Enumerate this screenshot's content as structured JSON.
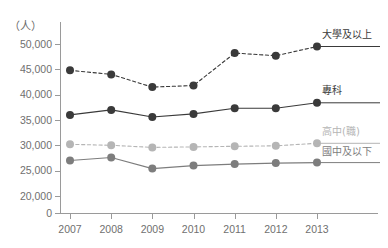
{
  "chart_data": {
    "type": "line",
    "title": "",
    "subtitle": "",
    "xlabel": "",
    "ylabel": "（人）",
    "unit_label": "（人）",
    "categories": [
      "2007",
      "2008",
      "2009",
      "2010",
      "2011",
      "2012",
      "2013"
    ],
    "x": [
      2007,
      2008,
      2009,
      2010,
      2011,
      2012,
      2013
    ],
    "ylim": [
      0,
      50000
    ],
    "y_axis_break": true,
    "yticks": [
      0,
      20000,
      25000,
      30000,
      35000,
      40000,
      45000,
      50000
    ],
    "ytick_labels": [
      "0",
      "20,000",
      "25,000",
      "30,000",
      "35,000",
      "40,000",
      "45,000",
      "50,000"
    ],
    "grid": false,
    "legend_position": "right-inline-labels",
    "series": [
      {
        "name": "大學及以上",
        "label": "大學及以上",
        "color": "#3a3a3a",
        "linestyle": "dashed",
        "marker": "circle",
        "values": [
          44800,
          44000,
          41500,
          41800,
          48200,
          47700,
          49500
        ]
      },
      {
        "name": "專科",
        "label": "專科",
        "color": "#3a3a3a",
        "linestyle": "solid",
        "marker": "circle",
        "values": [
          36000,
          37000,
          35600,
          36200,
          37300,
          37300,
          38400
        ]
      },
      {
        "name": "高中(職)",
        "label": "高中(職)",
        "color": "#b5b5b5",
        "linestyle": "dashed",
        "marker": "circle",
        "values": [
          30200,
          30000,
          29600,
          29700,
          29800,
          29900,
          30400
        ]
      },
      {
        "name": "國中及以下",
        "label": "國中及以下",
        "color": "#7d7d7d",
        "linestyle": "solid",
        "marker": "circle",
        "values": [
          27000,
          27600,
          25400,
          26000,
          26300,
          26500,
          26600
        ]
      }
    ]
  },
  "axis": {
    "unit": "（人）",
    "ytick_labels": [
      "50,000",
      "45,000",
      "40,000",
      "35,000",
      "30,000",
      "25,000",
      "20,000",
      "0"
    ],
    "xtick_labels": [
      "2007",
      "2008",
      "2009",
      "2010",
      "2011",
      "2012",
      "2013"
    ]
  },
  "legend": {
    "items": [
      {
        "label": "大學及以上",
        "color": "#3a3a3a"
      },
      {
        "label": "專科",
        "color": "#3a3a3a"
      },
      {
        "label": "高中(職)",
        "color": "#b5b5b5"
      },
      {
        "label": "國中及以下",
        "color": "#7d7d7d"
      }
    ]
  },
  "colors": {
    "series_dark": "#3a3a3a",
    "series_mid": "#7d7d7d",
    "series_light": "#b5b5b5",
    "axis": "#9a9a9a",
    "tick_text": "#70706f",
    "background": "#ffffff"
  }
}
